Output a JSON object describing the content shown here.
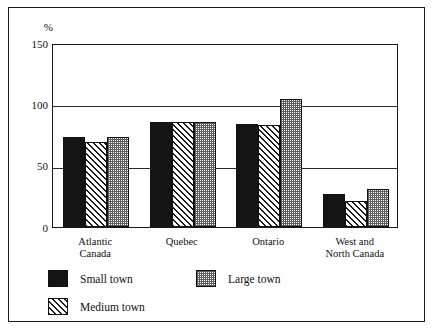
{
  "chart_data": {
    "type": "bar",
    "title": "",
    "xlabel": "",
    "ylabel": "%",
    "ylim": [
      0,
      150
    ],
    "yticks": [
      0,
      50,
      100,
      150
    ],
    "ytick_labels": [
      "0",
      "50",
      "100",
      "150"
    ],
    "grid": "horizontal gridlines at 50 and 100",
    "legend_position": "below-axis",
    "categories": [
      "Atlantic\nCanada",
      "Quebec",
      "Ontario",
      "West and\nNorth Canada"
    ],
    "series": [
      {
        "name": "Small town",
        "values": [
          73,
          86,
          84,
          27
        ]
      },
      {
        "name": "Medium town",
        "values": [
          69,
          86,
          83,
          21
        ]
      },
      {
        "name": "Large town",
        "values": [
          73,
          86,
          104,
          31
        ]
      }
    ]
  },
  "axis": {
    "unit_label": "%"
  },
  "legend": {
    "items": [
      {
        "label": "Small town",
        "pattern": "solid-black"
      },
      {
        "label": "Large town",
        "pattern": "checkered-grey"
      },
      {
        "label": "Medium town",
        "pattern": "diagonal-hatch"
      }
    ]
  }
}
